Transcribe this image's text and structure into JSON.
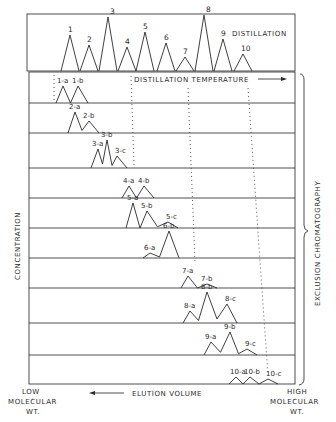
{
  "figure": {
    "top_panel_label": "DISTILLATION",
    "x_axis_top_label": "DISTILLATION TEMPERATURE",
    "y_axis_label": "CONCENTRATION",
    "right_bracket_label": "EXCLUSION CHROMATOGRAPHY",
    "x_axis_bottom_label": "ELUTION VOLUME",
    "left_end_label": [
      "LOW",
      "MOLECULAR",
      "WT."
    ],
    "right_end_label": [
      "HIGH",
      "MOLECULAR",
      "WT."
    ]
  },
  "distillation_peaks": [
    {
      "label": "1",
      "x": 70,
      "h": 36
    },
    {
      "label": "2",
      "x": 89,
      "h": 26
    },
    {
      "label": "3",
      "x": 108,
      "h": 54
    },
    {
      "label": "4",
      "x": 127,
      "h": 24
    },
    {
      "label": "5",
      "x": 145,
      "h": 39
    },
    {
      "label": "6",
      "x": 166,
      "h": 28
    },
    {
      "label": "7",
      "x": 185,
      "h": 14
    },
    {
      "label": "8",
      "x": 204,
      "h": 56
    },
    {
      "label": "9",
      "x": 223,
      "h": 32
    },
    {
      "label": "10",
      "x": 243,
      "h": 17
    }
  ],
  "chromatography_rows": [
    {
      "fraction": "1",
      "peaks": [
        {
          "label": "1-a",
          "x": 63,
          "h": 17
        },
        {
          "label": "1-b",
          "x": 78,
          "h": 17
        }
      ]
    },
    {
      "fraction": "2",
      "peaks": [
        {
          "label": "2-a",
          "x": 75,
          "h": 21
        },
        {
          "label": "2-b",
          "x": 89,
          "h": 12
        }
      ]
    },
    {
      "fraction": "3",
      "peaks": [
        {
          "label": "3-a",
          "x": 98,
          "h": 19
        },
        {
          "label": "3-b",
          "x": 107,
          "h": 28
        },
        {
          "label": "3-c",
          "x": 117,
          "h": 12
        }
      ]
    },
    {
      "fraction": "4",
      "peaks": [
        {
          "label": "4-a",
          "x": 129,
          "h": 12
        },
        {
          "label": "4-b",
          "x": 144,
          "h": 12
        }
      ]
    },
    {
      "fraction": "5",
      "peaks": [
        {
          "label": "5-a",
          "x": 133,
          "h": 25
        },
        {
          "label": "5-b",
          "x": 147,
          "h": 17
        },
        {
          "label": "5-c",
          "x": 168,
          "h": 6
        }
      ]
    },
    {
      "fraction": "6",
      "peaks": [
        {
          "label": "6-a",
          "x": 150,
          "h": 5
        },
        {
          "label": "6-b",
          "x": 169,
          "h": 27
        }
      ]
    },
    {
      "fraction": "7",
      "peaks": [
        {
          "label": "7-a",
          "x": 188,
          "h": 12
        },
        {
          "label": "7-b",
          "x": 207,
          "h": 4
        }
      ]
    },
    {
      "fraction": "8",
      "peaks": [
        {
          "label": "8-a",
          "x": 190,
          "h": 12
        },
        {
          "label": "8-b",
          "x": 207,
          "h": 31
        },
        {
          "label": "8-c",
          "x": 227,
          "h": 19
        }
      ]
    },
    {
      "fraction": "9",
      "peaks": [
        {
          "label": "9-a",
          "x": 211,
          "h": 13
        },
        {
          "label": "9-b",
          "x": 230,
          "h": 23
        },
        {
          "label": "9-c",
          "x": 247,
          "h": 6
        }
      ]
    },
    {
      "fraction": "10",
      "peaks": [
        {
          "label": "10-a",
          "x": 236,
          "h": 7
        },
        {
          "label": "10-b",
          "x": 250,
          "h": 7
        },
        {
          "label": "10-c",
          "x": 268,
          "h": 5
        }
      ]
    }
  ],
  "chart_data": {
    "type": "line",
    "xlabel": "ELUTION VOLUME (LOW MOLECULAR WT. ← → HIGH MOLECULAR WT.); top axis: DISTILLATION TEMPERATURE →",
    "ylabel": "CONCENTRATION",
    "series": [
      {
        "name": "DISTILLATION",
        "categories": [
          "1",
          "2",
          "3",
          "4",
          "5",
          "6",
          "7",
          "8",
          "9",
          "10"
        ],
        "relative_heights": [
          36,
          26,
          54,
          24,
          39,
          28,
          14,
          56,
          32,
          17
        ]
      },
      {
        "name": "1",
        "categories": [
          "1-a",
          "1-b"
        ],
        "relative_heights": [
          17,
          17
        ]
      },
      {
        "name": "2",
        "categories": [
          "2-a",
          "2-b"
        ],
        "relative_heights": [
          21,
          12
        ]
      },
      {
        "name": "3",
        "categories": [
          "3-a",
          "3-b",
          "3-c"
        ],
        "relative_heights": [
          19,
          28,
          12
        ]
      },
      {
        "name": "4",
        "categories": [
          "4-a",
          "4-b"
        ],
        "relative_heights": [
          12,
          12
        ]
      },
      {
        "name": "5",
        "categories": [
          "5-a",
          "5-b",
          "5-c"
        ],
        "relative_heights": [
          25,
          17,
          6
        ]
      },
      {
        "name": "6",
        "categories": [
          "6-a",
          "6-b"
        ],
        "relative_heights": [
          5,
          27
        ]
      },
      {
        "name": "7",
        "categories": [
          "7-a",
          "7-b"
        ],
        "relative_heights": [
          12,
          4
        ]
      },
      {
        "name": "8",
        "categories": [
          "8-a",
          "8-b",
          "8-c"
        ],
        "relative_heights": [
          12,
          31,
          19
        ]
      },
      {
        "name": "9",
        "categories": [
          "9-a",
          "9-b",
          "9-c"
        ],
        "relative_heights": [
          13,
          23,
          6
        ]
      },
      {
        "name": "10",
        "categories": [
          "10-a",
          "10-b",
          "10-c"
        ],
        "relative_heights": [
          7,
          7,
          5
        ]
      }
    ],
    "annotations": [
      "DISTILLATION",
      "DISTILLATION TEMPERATURE",
      "EXCLUSION CHROMATOGRAPHY",
      "LOW MOLECULAR WT.",
      "HIGH MOLECULAR WT."
    ],
    "grid": false,
    "legend": "none"
  }
}
